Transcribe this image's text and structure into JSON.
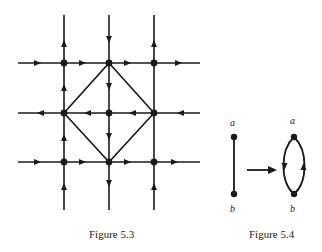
{
  "figures": [
    {
      "id": "fig53",
      "caption": "Figure 5.3",
      "description": "3x3 grid graph with directed edges and a diamond of diagonal edges",
      "grid": {
        "xs": [
          64,
          109,
          154
        ],
        "ys": [
          63,
          113,
          162
        ],
        "rows": [
          {
            "y": 63,
            "direction": "right"
          },
          {
            "y": 113,
            "direction": "left"
          },
          {
            "y": 162,
            "direction": "right"
          }
        ],
        "columns": [
          {
            "x": 64,
            "direction": "up"
          },
          {
            "x": 109,
            "direction": "down"
          },
          {
            "x": 154,
            "direction": "up"
          }
        ],
        "diamond": [
          [
            109,
            63
          ],
          [
            154,
            113
          ],
          [
            109,
            162
          ],
          [
            64,
            113
          ]
        ]
      }
    },
    {
      "id": "fig54",
      "caption": "Figure 5.4",
      "left": {
        "top_label": "a",
        "bottom_label": "b"
      },
      "right": {
        "top_label": "a",
        "bottom_label": "b"
      },
      "arrow": "maps-to"
    }
  ],
  "captions": {
    "fig53": "Figure 5.3",
    "fig54": "Figure 5.4"
  },
  "labels": {
    "left_a": "a",
    "left_b": "b",
    "right_a": "a",
    "right_b": "b"
  }
}
